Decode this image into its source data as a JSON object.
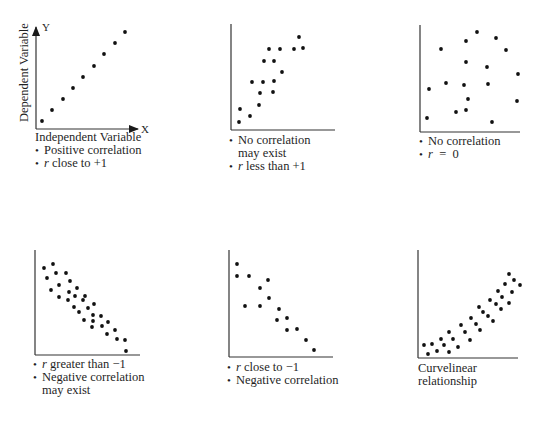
{
  "chart_data": [
    {
      "type": "scatter",
      "id": "positive",
      "title": "",
      "xlabel": "Independent Variable",
      "ylabel": "Dependent Variable",
      "x_axis_letter": "X",
      "y_axis_letter": "Y",
      "notes": [
        "Positive correlation",
        "r close to +1"
      ],
      "points": [
        [
          1,
          1
        ],
        [
          2,
          2
        ],
        [
          3,
          3
        ],
        [
          4,
          4
        ],
        [
          5,
          5
        ],
        [
          6,
          6
        ],
        [
          7,
          7
        ],
        [
          8,
          8
        ],
        [
          9,
          9
        ]
      ]
    },
    {
      "type": "scatter",
      "id": "weak-positive",
      "notes": [
        "No correlation may exist",
        "r less than +1"
      ],
      "points": [
        [
          1,
          1
        ],
        [
          1.2,
          2
        ],
        [
          2,
          1.5
        ],
        [
          3,
          2.5
        ],
        [
          3,
          3.6
        ],
        [
          2.2,
          4.6
        ],
        [
          3.3,
          4.6
        ],
        [
          4.3,
          3.7
        ],
        [
          4.4,
          4.7
        ],
        [
          5.2,
          5.5
        ],
        [
          3.4,
          6.5
        ],
        [
          4.4,
          6.5
        ],
        [
          3.9,
          7.7
        ],
        [
          5,
          7.7
        ],
        [
          6.4,
          7.7
        ],
        [
          7.3,
          7.8
        ],
        [
          6.9,
          8.8
        ]
      ]
    },
    {
      "type": "scatter",
      "id": "no-correlation",
      "notes": [
        "No correlation",
        "r = 0"
      ],
      "points": [
        [
          5.7,
          9.3
        ],
        [
          7.6,
          8.7
        ],
        [
          4.6,
          8.4
        ],
        [
          2.1,
          7.6
        ],
        [
          8.6,
          7.5
        ],
        [
          4.6,
          6.4
        ],
        [
          6.7,
          5.9
        ],
        [
          9.8,
          5.2
        ],
        [
          0.9,
          3.9
        ],
        [
          2.6,
          4.5
        ],
        [
          4.4,
          4.3
        ],
        [
          6.8,
          4.4
        ],
        [
          4.8,
          3.0
        ],
        [
          9.7,
          2.8
        ],
        [
          3.6,
          1.8
        ],
        [
          4.6,
          2.0
        ],
        [
          0.7,
          1.2
        ],
        [
          7.2,
          0.8
        ]
      ]
    },
    {
      "type": "scatter",
      "id": "weak-negative",
      "notes": [
        "r greater than −1",
        "Negative correlation may exist"
      ],
      "points": [
        [
          0.9,
          8.1
        ],
        [
          1.8,
          8.5
        ],
        [
          1.2,
          7.2
        ],
        [
          2.1,
          7.7
        ],
        [
          3.1,
          7.7
        ],
        [
          3.5,
          6.9
        ],
        [
          2.4,
          6.6
        ],
        [
          1.6,
          6.1
        ],
        [
          3.4,
          5.9
        ],
        [
          4.2,
          6.3
        ],
        [
          2.4,
          5.4
        ],
        [
          3.3,
          5.1
        ],
        [
          4,
          5.5
        ],
        [
          5,
          5.5
        ],
        [
          4.8,
          5.1
        ],
        [
          5.9,
          4.7
        ],
        [
          3.9,
          4.4
        ],
        [
          5.3,
          4.3
        ],
        [
          4.4,
          3.9
        ],
        [
          5.8,
          3.6
        ],
        [
          6.6,
          3.5
        ],
        [
          4.9,
          3.1
        ],
        [
          5.8,
          3.0
        ],
        [
          7.3,
          2.9
        ],
        [
          5.7,
          2.4
        ],
        [
          6.7,
          2.5
        ],
        [
          8,
          2.1
        ],
        [
          7.2,
          1.7
        ],
        [
          8.2,
          1.2
        ],
        [
          9,
          1.1
        ],
        [
          9.1,
          0.0
        ]
      ]
    },
    {
      "type": "scatter",
      "id": "strong-negative",
      "notes": [
        "r close to −1",
        "Negative correlation"
      ],
      "points": [
        [
          0.8,
          8.7
        ],
        [
          0.8,
          7.6
        ],
        [
          2,
          7.6
        ],
        [
          3.8,
          7.2
        ],
        [
          3,
          6.4
        ],
        [
          3.9,
          5.5
        ],
        [
          1.6,
          4.7
        ],
        [
          3,
          4.7
        ],
        [
          4.9,
          4.4
        ],
        [
          5.7,
          3.6
        ],
        [
          4.7,
          3.4
        ],
        [
          6.7,
          2.6
        ],
        [
          5.7,
          2.5
        ],
        [
          7.6,
          1.6
        ],
        [
          8.4,
          0.7
        ]
      ]
    },
    {
      "type": "scatter",
      "id": "curvilinear",
      "notes": [
        "Curvelinear relationship"
      ],
      "points": [
        [
          0.6,
          1.2
        ],
        [
          1,
          0.4
        ],
        [
          1.4,
          1.3
        ],
        [
          1.9,
          0.7
        ],
        [
          2.3,
          1.8
        ],
        [
          2.6,
          1.2
        ],
        [
          3.1,
          0.6
        ],
        [
          3.1,
          2.4
        ],
        [
          3.5,
          1.8
        ],
        [
          4,
          1.0
        ],
        [
          4.3,
          3.1
        ],
        [
          4.7,
          2.4
        ],
        [
          5.2,
          1.7
        ],
        [
          5.3,
          3.8
        ],
        [
          5.8,
          3.2
        ],
        [
          6.2,
          2.6
        ],
        [
          6.1,
          4.7
        ],
        [
          6.5,
          4.3
        ],
        [
          7,
          3.9
        ],
        [
          7.5,
          3.4
        ],
        [
          7.2,
          5.3
        ],
        [
          7.8,
          5.0
        ],
        [
          8.3,
          4.5
        ],
        [
          8,
          6.2
        ],
        [
          8.4,
          5.7
        ],
        [
          9.1,
          5.1
        ],
        [
          8.7,
          6.9
        ],
        [
          9.4,
          6.2
        ],
        [
          9.1,
          7.8
        ],
        [
          9.6,
          7.2
        ],
        [
          10.2,
          6.8
        ]
      ]
    }
  ],
  "plots": [
    {
      "axis": {
        "x0": 36,
        "y0": 129,
        "x1": 138,
        "ytop": 27,
        "arrows": true
      },
      "dots": [
        [
          42,
          121
        ],
        [
          52,
          110
        ],
        [
          63,
          99
        ],
        [
          73,
          88
        ],
        [
          83,
          77
        ],
        [
          94,
          66
        ],
        [
          104,
          54
        ],
        [
          115,
          43
        ],
        [
          125,
          32
        ]
      ],
      "labels": {
        "xlabel": "Independent Variable",
        "ylabel": "Dependent Variable",
        "x_letter": "X",
        "y_letter": "Y",
        "line1": "Positive correlation",
        "line2_pre": "r",
        "line2_post": " close to +1"
      }
    },
    {
      "axis": {
        "x0": 231,
        "y0": 130,
        "x1": 335,
        "ytop": 24,
        "arrows": false
      },
      "dots": [
        [
          239,
          122
        ],
        [
          240,
          109
        ],
        [
          250,
          116
        ],
        [
          259,
          105
        ],
        [
          260,
          93
        ],
        [
          252,
          82
        ],
        [
          263,
          82
        ],
        [
          273,
          92
        ],
        [
          274,
          81
        ],
        [
          282,
          72
        ],
        [
          264,
          61
        ],
        [
          274,
          61
        ],
        [
          269,
          49
        ],
        [
          280,
          49
        ],
        [
          294,
          49
        ],
        [
          303,
          48
        ],
        [
          299,
          37
        ]
      ],
      "labels": {
        "line1": "No correlation",
        "line1b": "may exist",
        "line2_pre": "r",
        "line2_post": " less than +1"
      }
    },
    {
      "axis": {
        "x0": 420,
        "y0": 132,
        "x1": 520,
        "ytop": 25,
        "arrows": false
      },
      "dots": [
        [
          477,
          32
        ],
        [
          496,
          38
        ],
        [
          466,
          41
        ],
        [
          441,
          49
        ],
        [
          506,
          50
        ],
        [
          466,
          62
        ],
        [
          487,
          67
        ],
        [
          518,
          74
        ],
        [
          429,
          89
        ],
        [
          446,
          83
        ],
        [
          464,
          85
        ],
        [
          488,
          84
        ],
        [
          468,
          99
        ],
        [
          517,
          101
        ],
        [
          456,
          112
        ],
        [
          466,
          110
        ],
        [
          427,
          118
        ],
        [
          492,
          122
        ]
      ],
      "labels": {
        "line1": "No correlation",
        "line2_pre": "r",
        "line2_post": "  =  0"
      }
    },
    {
      "axis": {
        "x0": 35,
        "y0": 355,
        "x1": 140,
        "ytop": 250,
        "arrows": false
      },
      "dots": [
        [
          44,
          268
        ],
        [
          53,
          264
        ],
        [
          47,
          278
        ],
        [
          56,
          273
        ],
        [
          66,
          273
        ],
        [
          70,
          281
        ],
        [
          59,
          285
        ],
        [
          51,
          290
        ],
        [
          69,
          292
        ],
        [
          77,
          288
        ],
        [
          59,
          297
        ],
        [
          68,
          300
        ],
        [
          75,
          296
        ],
        [
          85,
          296
        ],
        [
          83,
          300
        ],
        [
          94,
          304
        ],
        [
          74,
          307
        ],
        [
          88,
          308
        ],
        [
          79,
          312
        ],
        [
          93,
          315
        ],
        [
          101,
          316
        ],
        [
          84,
          320
        ],
        [
          93,
          321
        ],
        [
          108,
          322
        ],
        [
          92,
          327
        ],
        [
          102,
          326
        ],
        [
          115,
          330
        ],
        [
          107,
          334
        ],
        [
          117,
          339
        ],
        [
          125,
          340
        ],
        [
          126,
          351
        ]
      ],
      "labels": {
        "line1_pre": "r",
        "line1_post": " greater than −1",
        "line2": "Negative correlation",
        "line2b": "may exist"
      }
    },
    {
      "axis": {
        "x0": 229,
        "y0": 357,
        "x1": 333,
        "ytop": 250,
        "arrows": false
      },
      "dots": [
        [
          237,
          264
        ],
        [
          237,
          276
        ],
        [
          249,
          276
        ],
        [
          268,
          280
        ],
        [
          260,
          288
        ],
        [
          269,
          298
        ],
        [
          245,
          306
        ],
        [
          260,
          306
        ],
        [
          279,
          309
        ],
        [
          287,
          318
        ],
        [
          277,
          320
        ],
        [
          297,
          329
        ],
        [
          287,
          330
        ],
        [
          306,
          340
        ],
        [
          314,
          350
        ]
      ],
      "labels": {
        "line1_pre": "r",
        "line1_post": " close to −1",
        "line2": "Negative correlation"
      }
    },
    {
      "axis": {
        "x0": 418,
        "y0": 358,
        "x1": 518,
        "ytop": 250,
        "arrows": false
      },
      "dots": [
        [
          424,
          345
        ],
        [
          428,
          354
        ],
        [
          432,
          344
        ],
        [
          437,
          351
        ],
        [
          441,
          339
        ],
        [
          444,
          345
        ],
        [
          449,
          352
        ],
        [
          449,
          332
        ],
        [
          453,
          339
        ],
        [
          458,
          347
        ],
        [
          461,
          325
        ],
        [
          465,
          332
        ],
        [
          470,
          340
        ],
        [
          471,
          318
        ],
        [
          476,
          324
        ],
        [
          480,
          330
        ],
        [
          479,
          307
        ],
        [
          483,
          312
        ],
        [
          488,
          316
        ],
        [
          493,
          321
        ],
        [
          490,
          300
        ],
        [
          496,
          304
        ],
        [
          501,
          309
        ],
        [
          498,
          291
        ],
        [
          502,
          297
        ],
        [
          509,
          303
        ],
        [
          505,
          284
        ],
        [
          512,
          292
        ],
        [
          509,
          274
        ],
        [
          514,
          280
        ],
        [
          520,
          285
        ]
      ],
      "labels": {
        "line1": "Curvelinear",
        "line1b": "relationship"
      }
    }
  ]
}
